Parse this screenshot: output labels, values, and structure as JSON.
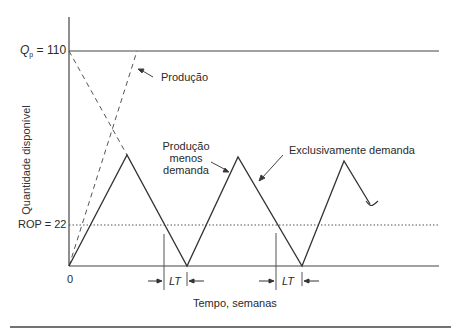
{
  "diagram": {
    "y_axis_label": "Quantidade disponível",
    "x_axis_label": "Tempo, semanas",
    "origin_label": "0",
    "qp_label_symbol": "Q",
    "qp_label_subscript": "p",
    "qp_label_value": " = 110",
    "rop_label": "ROP = 22",
    "annotations": {
      "production": "Produção",
      "production_minus_demand_line1": "Produção",
      "production_minus_demand_line2": "menos",
      "production_minus_demand_line3": "demanda",
      "demand_only": "Exclusivamente demanda"
    },
    "lead_time_labels": [
      "LT",
      "LT"
    ],
    "values": {
      "Qp": 110,
      "ROP": 22
    },
    "colors": {
      "line": "#333333",
      "axis": "#444444",
      "dashed": "#555555",
      "dotted": "#555555"
    }
  }
}
